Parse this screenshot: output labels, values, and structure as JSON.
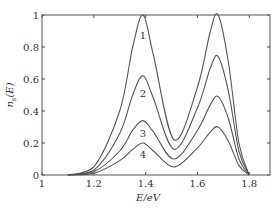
{
  "chart_data": {
    "type": "line",
    "title": "",
    "xlabel": "E/eV",
    "ylabel": "n_s(E)",
    "xlim": [
      1.0,
      1.88
    ],
    "ylim": [
      0,
      1
    ],
    "grid": false,
    "legend": "none (curves labeled inline 1-4)",
    "x_ticks": [
      1,
      1.2,
      1.4,
      1.6,
      1.8
    ],
    "x_tick_labels": [
      "1",
      "1.2",
      "1.4",
      "1.6",
      "1.8"
    ],
    "y_ticks": [
      0,
      0.2,
      0.4,
      0.6,
      0.8,
      1
    ],
    "y_tick_labels": [
      "0",
      "0.2",
      "0.4",
      "0.6",
      "0.8",
      "1"
    ],
    "x": [
      1.1,
      1.2,
      1.3,
      1.35,
      1.39,
      1.43,
      1.51,
      1.6,
      1.65,
      1.68,
      1.72,
      1.76,
      1.8
    ],
    "series": [
      {
        "name": "1",
        "values": [
          0.0,
          0.05,
          0.4,
          0.8,
          1.0,
          0.75,
          0.22,
          0.55,
          0.9,
          1.0,
          0.7,
          0.2,
          0.0
        ]
      },
      {
        "name": "2",
        "values": [
          0.0,
          0.03,
          0.26,
          0.5,
          0.62,
          0.48,
          0.16,
          0.42,
          0.67,
          0.74,
          0.52,
          0.15,
          0.0
        ]
      },
      {
        "name": "3",
        "values": [
          0.0,
          0.02,
          0.15,
          0.28,
          0.34,
          0.27,
          0.1,
          0.28,
          0.44,
          0.49,
          0.35,
          0.1,
          0.0
        ]
      },
      {
        "name": "4",
        "values": [
          0.0,
          0.01,
          0.09,
          0.16,
          0.2,
          0.15,
          0.05,
          0.17,
          0.27,
          0.3,
          0.21,
          0.06,
          0.0
        ]
      }
    ],
    "annotations": [
      {
        "text": "1",
        "x": 1.39,
        "y": 0.87
      },
      {
        "text": "2",
        "x": 1.39,
        "y": 0.51
      },
      {
        "text": "3",
        "x": 1.39,
        "y": 0.26
      },
      {
        "text": "4",
        "x": 1.39,
        "y": 0.13
      }
    ]
  },
  "axes": {
    "xlabel": "E/eV",
    "ylabel_main": "n",
    "ylabel_sub": "s",
    "ylabel_arg": "(E)"
  }
}
